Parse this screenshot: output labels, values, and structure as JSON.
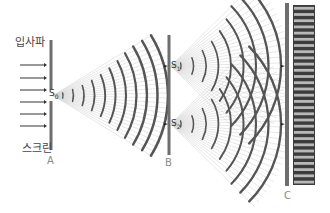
{
  "diagram": {
    "labels": {
      "incident_wave": "입사파",
      "screen": "스크린",
      "barrier_a": "A",
      "barrier_b": "B",
      "barrier_c": "C",
      "source_s0": "S",
      "source_s0_sub": "0",
      "source_s1": "S",
      "source_s1_sub": "1",
      "source_s2": "S",
      "source_s2_sub": "2"
    },
    "colors": {
      "barrier": "#6e6e6e",
      "wavefront": "#555555",
      "ray": "#cfcfcf",
      "arrow": "#333333",
      "fringe_dark": "#3c3c3c",
      "fringe_light": "#b8b8b8"
    },
    "geometry": {
      "barrier_a": {
        "x": 51,
        "y1": 40,
        "y2": 150,
        "gap": [
          90,
          101
        ]
      },
      "barrier_b": {
        "x": 169,
        "y1": 35,
        "y2": 155,
        "slit1_y": 66,
        "slit2_y": 124
      },
      "barrier_c": {
        "x": 287,
        "y1": 3,
        "y2": 186
      },
      "fringe_panel": {
        "x": 293,
        "y": 5,
        "width": 22,
        "height": 180,
        "light_stripes": 29
      },
      "incident_arrows_y": [
        65,
        78,
        90,
        102,
        114,
        126
      ],
      "wavefront_count_s0": 11,
      "wavefront_count_s1": 9,
      "wavefront_count_s2": 9
    }
  }
}
